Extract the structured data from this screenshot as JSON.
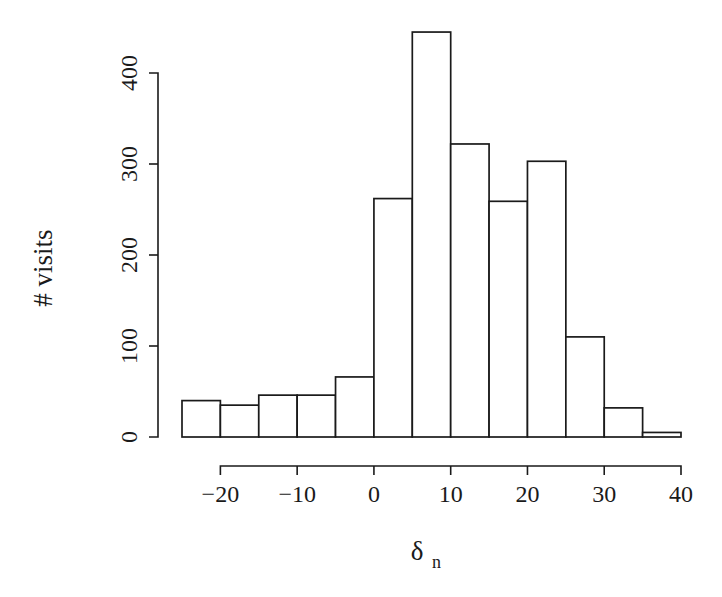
{
  "chart_data": {
    "type": "bar",
    "title": "",
    "subtitle": "",
    "xlabel": "δ",
    "xlabel_sub": "n",
    "ylabel": "# visits",
    "xlim": [
      -27,
      42
    ],
    "ylim": [
      0,
      455
    ],
    "grid": false,
    "legend": null,
    "bin_width": 5,
    "bin_edges": [
      -25,
      -20,
      -15,
      -10,
      -5,
      0,
      5,
      10,
      15,
      20,
      25,
      30,
      35,
      40
    ],
    "categories": [
      "-25 to -20",
      "-20 to -15",
      "-15 to -10",
      "-10 to -5",
      "-5 to 0",
      "0 to 5",
      "5 to 10",
      "10 to 15",
      "15 to 20",
      "20 to 25",
      "25 to 30",
      "30 to 35",
      "35 to 40"
    ],
    "bin_centers": [
      -22.5,
      -17.5,
      -12.5,
      -7.5,
      -2.5,
      2.5,
      7.5,
      12.5,
      17.5,
      22.5,
      27.5,
      32.5,
      37.5
    ],
    "values": [
      40,
      35,
      46,
      46,
      66,
      262,
      445,
      322,
      259,
      303,
      110,
      32,
      5
    ],
    "xticks": [
      -20,
      -10,
      0,
      10,
      20,
      30,
      40
    ],
    "xticklabels": [
      "−20",
      "−10",
      "0",
      "10",
      "20",
      "30",
      "40"
    ],
    "yticks": [
      0,
      100,
      200,
      300,
      400
    ],
    "yticklabels": [
      "0",
      "100",
      "200",
      "300",
      "400"
    ],
    "axis_color": "#1a1a1a",
    "bar_fill": "#ffffff",
    "bar_stroke": "#1a1a1a",
    "background": "#ffffff"
  }
}
